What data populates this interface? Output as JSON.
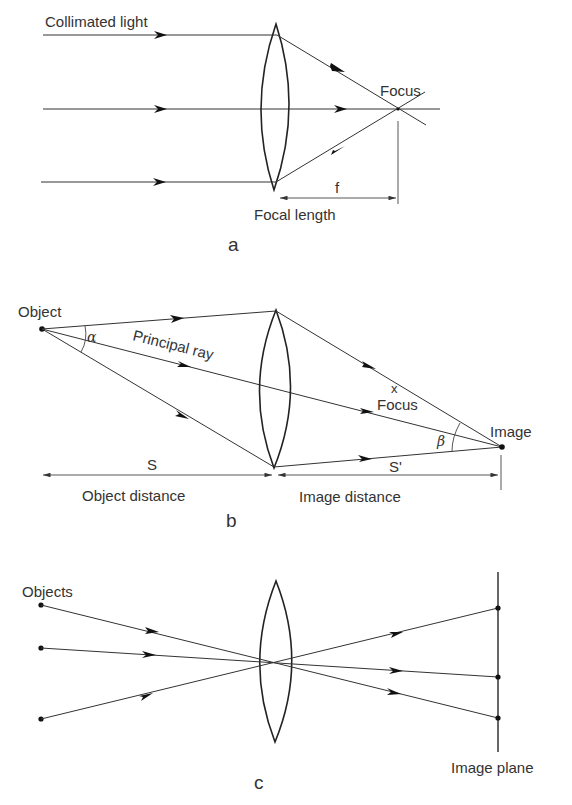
{
  "colors": {
    "ink": "#222222",
    "background": "#ffffff"
  },
  "panel_a": {
    "label": "a",
    "collimated_label": "Collimated light",
    "focus_label": "Focus",
    "f_label": "f",
    "focal_length_label": "Focal length"
  },
  "panel_b": {
    "label": "b",
    "object_label": "Object",
    "alpha_label": "α",
    "principal_ray_label": "Principal ray",
    "focus_mark": "x",
    "focus_label": "Focus",
    "image_label": "Image",
    "beta_label": "β",
    "s_label": "S",
    "s_prime_label": "S'",
    "object_distance_label": "Object distance",
    "image_distance_label": "Image distance"
  },
  "panel_c": {
    "label": "c",
    "objects_label": "Objects",
    "image_plane_label": "Image plane"
  }
}
